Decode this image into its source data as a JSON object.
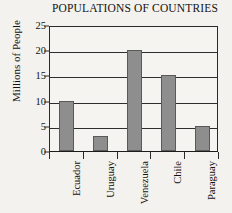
{
  "chart_data": {
    "type": "bar",
    "title": "POPULATIONS OF COUNTRIES",
    "xlabel": "",
    "ylabel": "Millions of People",
    "categories": [
      "Ecuador",
      "Uruguay",
      "Venezuela",
      "Chile",
      "Paraguay"
    ],
    "values": [
      10,
      3,
      20,
      15,
      5
    ],
    "ylim": [
      0,
      25
    ],
    "yticks": [
      0,
      5,
      10,
      15,
      20,
      25
    ],
    "grid": true,
    "legend": false,
    "bar_color": "#8e8e8e",
    "bar_edge_color": "#595959",
    "axis_color": "#2a2a2a",
    "background": "#f3f2ef"
  }
}
